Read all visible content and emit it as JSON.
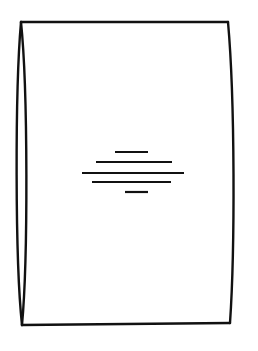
{
  "figure": {
    "stroke_color": "#111111",
    "background_color": "#ffffff",
    "outline": {
      "top_left": [
        21,
        22
      ],
      "top_right": [
        228,
        22
      ],
      "bottom_right": [
        230,
        323
      ],
      "bottom_left": [
        22,
        325
      ],
      "left_ellipse_inner_x": 17,
      "left_ellipse_outer_x": 27,
      "right_bulge_x": 234
    },
    "center_lines": [
      {
        "x1": 115,
        "x2": 148,
        "y": 152
      },
      {
        "x1": 96,
        "x2": 172,
        "y": 162
      },
      {
        "x1": 82,
        "x2": 184,
        "y": 173
      },
      {
        "x1": 92,
        "x2": 171,
        "y": 182
      },
      {
        "x1": 125,
        "x2": 148,
        "y": 192
      }
    ]
  }
}
